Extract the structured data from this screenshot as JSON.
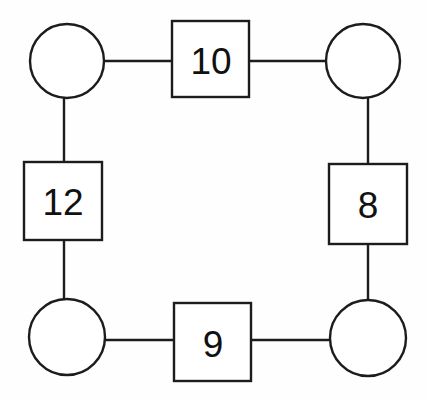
{
  "diagram": {
    "type": "graph-ring",
    "canvas": {
      "width": 427,
      "height": 400,
      "background": "#fefefe"
    },
    "style": {
      "stroke_color": "#1c1c1c",
      "fill_color": "#ffffff",
      "text_color": "#111111",
      "stroke_width": 2.4,
      "label_font_size": 37
    },
    "nodes": [
      {
        "id": "c-top-left",
        "shape": "circle",
        "label": "",
        "cx": 67,
        "cy": 61,
        "r": 37
      },
      {
        "id": "c-top-right",
        "shape": "circle",
        "label": "",
        "cx": 363,
        "cy": 61,
        "r": 37
      },
      {
        "id": "c-bottom-left",
        "shape": "circle",
        "label": "",
        "cx": 67,
        "cy": 337,
        "r": 38
      },
      {
        "id": "c-bottom-right",
        "shape": "circle",
        "label": "",
        "cx": 368,
        "cy": 338,
        "r": 38
      }
    ],
    "squares": [
      {
        "id": "sq-top",
        "label": "10",
        "x": 172,
        "y": 21,
        "w": 77,
        "h": 76,
        "cx": 210.5,
        "cy": 59,
        "position": "top"
      },
      {
        "id": "sq-left",
        "label": "12",
        "x": 24,
        "y": 162,
        "w": 78,
        "h": 78,
        "cx": 63,
        "cy": 201,
        "position": "left"
      },
      {
        "id": "sq-right",
        "label": "8",
        "x": 329,
        "y": 164,
        "w": 78,
        "h": 80,
        "cx": 368,
        "cy": 204,
        "position": "right"
      },
      {
        "id": "sq-bottom",
        "label": "9",
        "x": 174,
        "y": 303,
        "w": 77,
        "h": 78,
        "cx": 212.5,
        "cy": 342,
        "position": "bottom"
      }
    ],
    "edges": [
      {
        "id": "edge-tl-to-10",
        "from": "c-top-left",
        "to": "sq-top",
        "x1": 104,
        "y1": 61,
        "x2": 172,
        "y2": 61,
        "orientation": "horizontal"
      },
      {
        "id": "edge-10-to-tr",
        "from": "sq-top",
        "to": "c-top-right",
        "x1": 249,
        "y1": 61,
        "x2": 326,
        "y2": 61,
        "orientation": "horizontal"
      },
      {
        "id": "edge-tl-to-12",
        "from": "c-top-left",
        "to": "sq-left",
        "x1": 64,
        "y1": 98,
        "x2": 64,
        "y2": 162,
        "orientation": "vertical"
      },
      {
        "id": "edge-tr-to-8",
        "from": "c-top-right",
        "to": "sq-right",
        "x1": 368,
        "y1": 98,
        "x2": 368,
        "y2": 164,
        "orientation": "vertical"
      },
      {
        "id": "edge-12-to-bl",
        "from": "sq-left",
        "to": "c-bottom-left",
        "x1": 64,
        "y1": 240,
        "x2": 64,
        "y2": 300,
        "orientation": "vertical"
      },
      {
        "id": "edge-8-to-br",
        "from": "sq-right",
        "to": "c-bottom-right",
        "x1": 368,
        "y1": 244,
        "x2": 368,
        "y2": 300,
        "orientation": "vertical"
      },
      {
        "id": "edge-bl-to-9",
        "from": "c-bottom-left",
        "to": "sq-bottom",
        "x1": 104,
        "y1": 340,
        "x2": 174,
        "y2": 340,
        "orientation": "horizontal"
      },
      {
        "id": "edge-9-to-br",
        "from": "sq-bottom",
        "to": "c-bottom-right",
        "x1": 251,
        "y1": 340,
        "x2": 331,
        "y2": 340,
        "orientation": "horizontal"
      }
    ],
    "labels": {
      "top": "10",
      "left": "12",
      "right": "8",
      "bottom": "9"
    }
  }
}
